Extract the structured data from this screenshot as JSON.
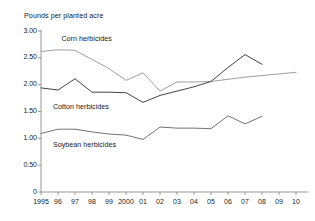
{
  "chart_data": {
    "type": "line",
    "title": "Pounds per planted acre",
    "xlabel": "",
    "ylabel": "Pounds per planted acre",
    "x": [
      1995,
      1996,
      1997,
      1998,
      1999,
      2000,
      2001,
      2002,
      2003,
      2004,
      2005,
      2006,
      2007,
      2008,
      2009,
      2010
    ],
    "xtick_labels": [
      "1995",
      "96",
      "97",
      "98",
      "99",
      "2000",
      "01",
      "02",
      "03",
      "04",
      "05",
      "06",
      "07",
      "08",
      "09",
      "10"
    ],
    "ytick_labels": [
      "0",
      "0.50",
      "1.00",
      "1.50",
      "2.00",
      "2.50",
      "3.00"
    ],
    "ytick_values": [
      0,
      0.5,
      1.0,
      1.5,
      2.0,
      2.5,
      3.0
    ],
    "ylim": [
      0,
      3.0
    ],
    "grid": false,
    "legend_position": "inline-annotations",
    "series": [
      {
        "name": "Corn herbicides",
        "color": "#9a9a9a",
        "values": [
          2.62,
          2.65,
          2.64,
          2.47,
          2.3,
          2.08,
          2.22,
          1.88,
          2.05,
          2.05,
          2.06,
          2.1,
          2.14,
          2.17,
          2.2,
          2.23
        ]
      },
      {
        "name": "Cotton herbicides",
        "color": "#3a3a3a",
        "values": [
          1.94,
          1.9,
          2.11,
          1.86,
          1.86,
          1.85,
          1.67,
          1.8,
          1.88,
          1.96,
          2.06,
          2.32,
          2.56,
          2.38,
          null,
          null
        ]
      },
      {
        "name": "Soybean herbicides",
        "color": "#6a6a6a",
        "values": [
          1.09,
          1.17,
          1.17,
          1.12,
          1.08,
          1.06,
          0.98,
          1.21,
          1.19,
          1.19,
          1.18,
          1.42,
          1.27,
          1.41,
          null,
          null
        ]
      }
    ],
    "annotations": [
      {
        "text": "Corn herbicides",
        "x": 1996.2,
        "y": 2.85
      },
      {
        "text": "Cotton herbicides",
        "x": 1995.7,
        "y": 1.58
      },
      {
        "text": "Soybean herbicides",
        "x": 1995.7,
        "y": 0.87
      }
    ]
  }
}
